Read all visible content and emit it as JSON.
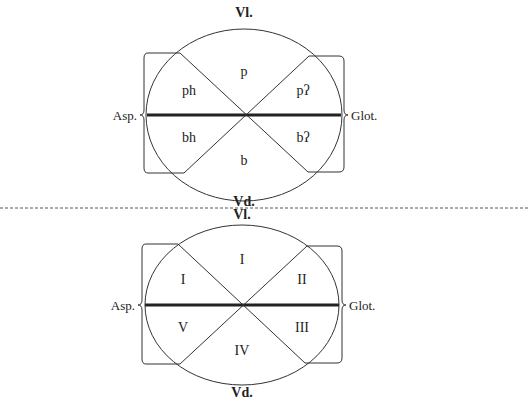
{
  "diagrams": [
    {
      "id": "phonetic",
      "top_label": "Vl.",
      "bottom_label": "Vd.",
      "left_label": "Asp.",
      "right_label": "Glot.",
      "sectors": {
        "top": "p",
        "upper_left": "ph",
        "upper_right": "pʔ",
        "lower_left": "bh",
        "lower_right": "bʔ",
        "bottom": "b"
      }
    },
    {
      "id": "roman",
      "top_label": "Vl.",
      "bottom_label": "Vd.",
      "left_label": "Asp.",
      "right_label": "Glot.",
      "sectors": {
        "top": "I",
        "upper_left": "I",
        "upper_right": "II",
        "lower_left": "V",
        "lower_right": "III",
        "bottom": "IV"
      }
    }
  ],
  "colors": {
    "line": "#333333",
    "divider": "#555555"
  }
}
